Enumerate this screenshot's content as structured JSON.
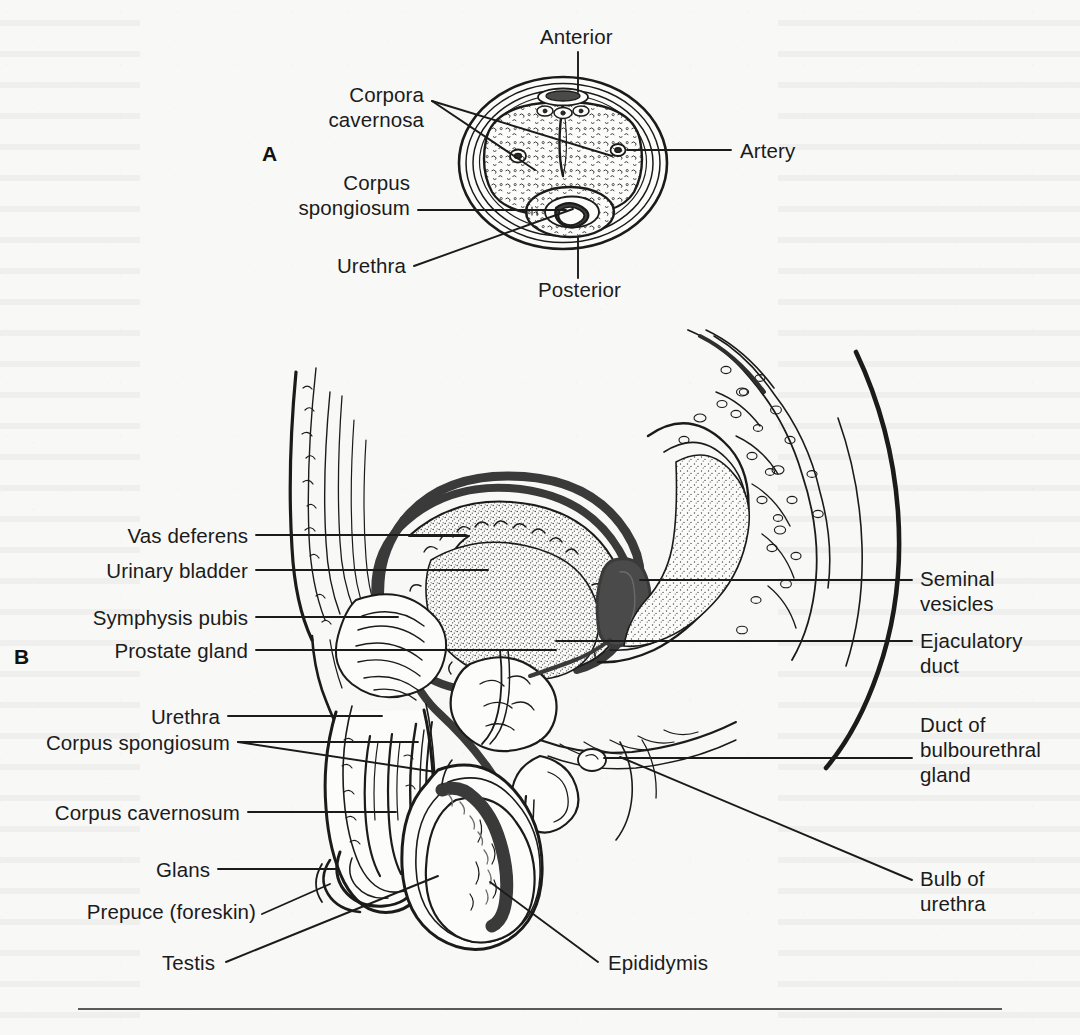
{
  "figure": {
    "background_color": "#f8f8f7",
    "ink_color": "#1b1b1b",
    "panels": [
      {
        "id": "A",
        "letter": "A",
        "caption": "Cross section of the penis"
      },
      {
        "id": "B",
        "letter": "B",
        "caption": "Sagittal section of the male pelvis"
      }
    ]
  },
  "panel_a": {
    "letter": "A",
    "labels": {
      "anterior": "Anterior",
      "posterior": "Posterior",
      "corpora_cavernosa": "Corpora\ncavernosa",
      "corpus_spongiosum": "Corpus\nspongiosum",
      "urethra": "Urethra",
      "artery": "Artery"
    }
  },
  "panel_b": {
    "letter": "B",
    "labels_left": [
      "Vas deferens",
      "Urinary bladder",
      "Symphysis pubis",
      "Prostate gland",
      "Urethra",
      "Corpus spongiosum",
      "Corpus cavernosum",
      "Glans",
      "Prepuce (foreskin)"
    ],
    "labels_bottom": [
      "Testis",
      "Epididymis"
    ],
    "labels_right": [
      "Seminal\nvesicles",
      "Ejaculatory\nduct",
      "Duct of\nbulbourethral\ngland",
      "Bulb of\nurethra"
    ]
  }
}
